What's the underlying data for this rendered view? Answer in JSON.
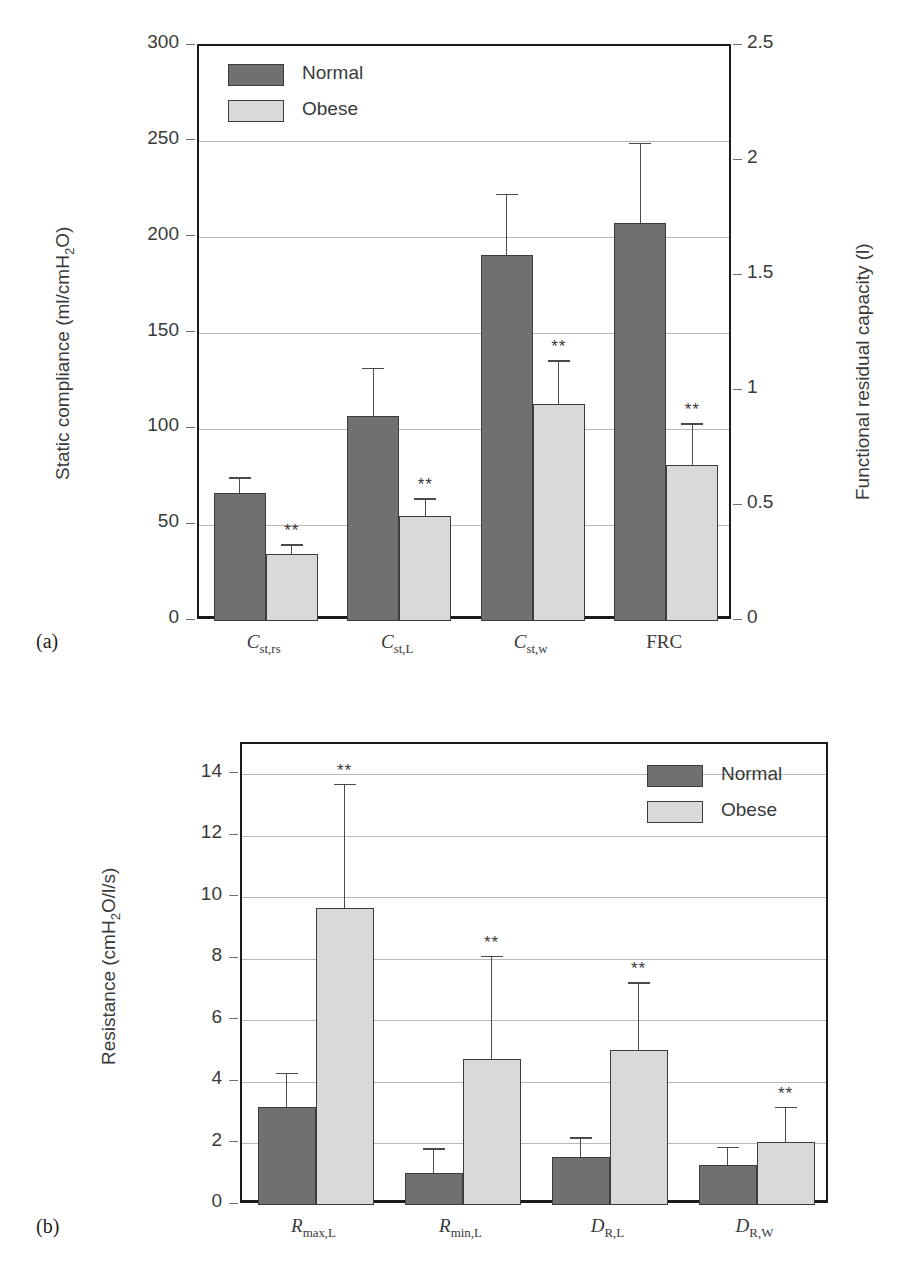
{
  "figure": {
    "panel_a_label": "(a)",
    "panel_b_label": "(b)"
  },
  "legend": {
    "normal_label": "Normal",
    "obese_label": "Obese",
    "normal_color": "#70706f",
    "obese_color": "#d9d9d7"
  },
  "significance_marker": "**",
  "chart_data": [
    {
      "id": "panel-a",
      "type": "bar",
      "title": "",
      "xlabel": "",
      "ylabel": "Static compliance (ml/cmH₂O)",
      "ylabel_parts": {
        "pre": "Static compliance (ml/cmH",
        "sub": "2",
        "post": "O)"
      },
      "y2label": "Functional residual capacity (l)",
      "ylim": [
        0,
        300
      ],
      "yticks": [
        0,
        50,
        100,
        150,
        200,
        250,
        300
      ],
      "ytick_labels": [
        "0",
        "50",
        "100",
        "150",
        "200",
        "250",
        "300"
      ],
      "y2lim": [
        0,
        2.5
      ],
      "y2ticks": [
        0,
        0.5,
        1,
        1.5,
        2,
        2.5
      ],
      "y2tick_labels": [
        "0",
        "0.5",
        "1",
        "1.5",
        "2",
        "2.5"
      ],
      "grid": true,
      "legend_position": "top-left",
      "categories": [
        "C_st,rs",
        "C_st,L",
        "C_st,w",
        "FRC"
      ],
      "category_labels": [
        {
          "main": "C",
          "sub": "st,rs",
          "italic": true
        },
        {
          "main": "C",
          "sub": "st,L",
          "italic": true
        },
        {
          "main": "C",
          "sub": "st,w",
          "italic": true
        },
        {
          "main": "FRC",
          "sub": "",
          "italic": false
        }
      ],
      "series": [
        {
          "name": "Normal",
          "values": [
            67,
            107,
            191,
            1.73
          ],
          "errors": [
            8,
            25,
            32,
            0.35
          ],
          "axis": [
            "left",
            "left",
            "left",
            "right"
          ],
          "significance": [
            "",
            "",
            "",
            ""
          ]
        },
        {
          "name": "Obese",
          "values": [
            35,
            55,
            113,
            0.68
          ],
          "errors": [
            5,
            9,
            23,
            0.18
          ],
          "axis": [
            "left",
            "left",
            "left",
            "right"
          ],
          "significance": [
            "**",
            "**",
            "**",
            "**"
          ]
        }
      ]
    },
    {
      "id": "panel-b",
      "type": "bar",
      "title": "",
      "xlabel": "",
      "ylabel": "Resistance (cmH₂O/l/s)",
      "ylabel_parts": {
        "pre": "Resistance (cmH",
        "sub": "2",
        "post": "O/l/s)"
      },
      "ylim": [
        0,
        15
      ],
      "yticks": [
        0,
        2,
        4,
        6,
        8,
        10,
        12,
        14
      ],
      "ytick_labels": [
        "0",
        "2",
        "4",
        "6",
        "8",
        "10",
        "12",
        "14"
      ],
      "grid": true,
      "legend_position": "top-right",
      "categories": [
        "R_max,L",
        "R_min,L",
        "D_R,L",
        "D_R,W"
      ],
      "category_labels": [
        {
          "main": "R",
          "sub": "max,L",
          "italic": true
        },
        {
          "main": "R",
          "sub": "min,L",
          "italic": true
        },
        {
          "main": "D",
          "sub": "R,L",
          "italic": true
        },
        {
          "main": "D",
          "sub": "R,W",
          "italic": true
        }
      ],
      "series": [
        {
          "name": "Normal",
          "values": [
            3.2,
            1.05,
            1.55,
            1.3
          ],
          "errors": [
            1.1,
            0.8,
            0.65,
            0.6
          ],
          "significance": [
            "",
            "",
            "",
            ""
          ]
        },
        {
          "name": "Obese",
          "values": [
            9.65,
            4.75,
            5.05,
            2.05
          ],
          "errors": [
            4.05,
            3.35,
            2.2,
            1.15
          ],
          "significance": [
            "**",
            "**",
            "**",
            "**"
          ]
        }
      ]
    }
  ]
}
